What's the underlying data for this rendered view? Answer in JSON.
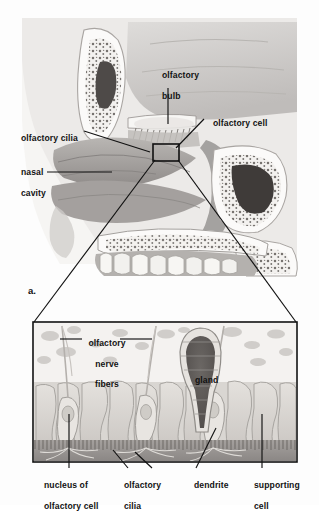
{
  "figure": {
    "panel_letter": "a.",
    "style": "grayscale medical illustration"
  },
  "colors": {
    "background": "#fdfdfd",
    "line": "#111111",
    "text": "#131313",
    "bone_light": "#f2f0ed",
    "brain_gray": "#c9c7c5",
    "tissue_mid": "#b5b2b0",
    "tissue_dark": "#8e8b89",
    "cavity_dark": "#4a4745",
    "cell_body": "#d8d5d1",
    "mucus": "#9b9795"
  },
  "upper_illustration": {
    "name": "sagittal-head-section",
    "labels": [
      {
        "id": "olfactory-bulb",
        "text_lines": [
          "olfactory",
          "bulb"
        ],
        "x": 152,
        "y": 66,
        "align": "left"
      },
      {
        "id": "olfactory-cell",
        "text_lines": [
          "olfactory cell"
        ],
        "x": 205,
        "y": 113,
        "align": "left"
      },
      {
        "id": "olfactory-cilia",
        "text_lines": [
          "olfactory cilia"
        ],
        "x": 12,
        "y": 128,
        "align": "left"
      },
      {
        "id": "nasal-cavity",
        "text_lines": [
          "nasal",
          "cavity"
        ],
        "x": 12,
        "y": 163,
        "align": "left"
      }
    ],
    "detail_box": {
      "x": 153,
      "y": 144,
      "w": 26,
      "h": 17
    }
  },
  "inset_illustration": {
    "name": "olfactory-epithelium-detail",
    "frame": {
      "x": 33,
      "y": 322,
      "w": 264,
      "h": 140
    },
    "labels": [
      {
        "id": "olfactory-nerve-fibers",
        "text_lines": [
          "olfactory",
          "nerve",
          "fibers"
        ],
        "x": 90,
        "y": 327,
        "align": "center"
      },
      {
        "id": "gland",
        "text_lines": [
          "gland"
        ],
        "x": 186,
        "y": 369,
        "align": "left"
      },
      {
        "id": "nucleus-of-olfactory-cell",
        "text_lines": [
          "nucleus of",
          "olfactory cell"
        ],
        "x": 35,
        "y": 472,
        "align": "left"
      },
      {
        "id": "olfactory-cilia-inset",
        "text_lines": [
          "olfactory",
          "cilia"
        ],
        "x": 115,
        "y": 472,
        "align": "left"
      },
      {
        "id": "dendrite",
        "text_lines": [
          "dendrite"
        ],
        "x": 185,
        "y": 472,
        "align": "left"
      },
      {
        "id": "supporting-cell",
        "text_lines": [
          "supporting",
          "cell"
        ],
        "x": 245,
        "y": 472,
        "align": "left"
      }
    ]
  }
}
